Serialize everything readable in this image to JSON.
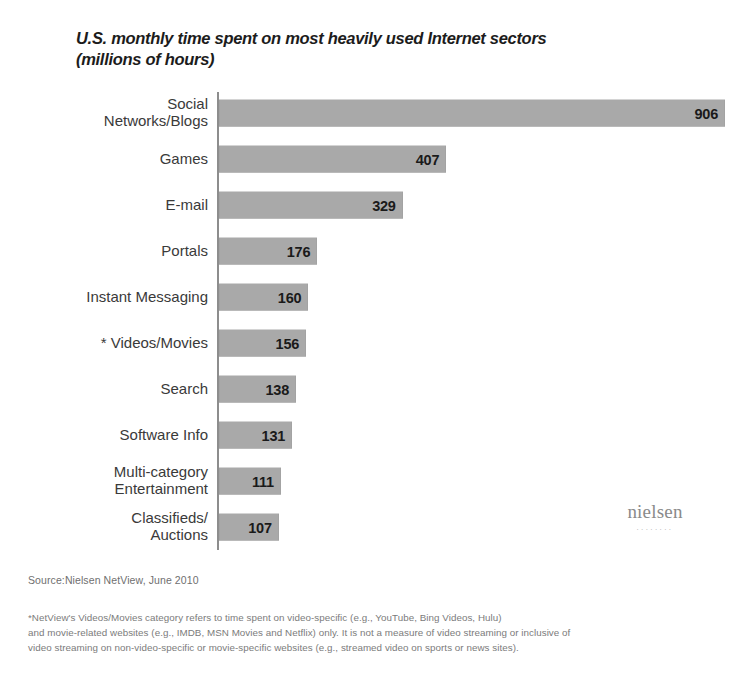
{
  "chart_data": {
    "type": "bar",
    "orientation": "horizontal",
    "title": "U.S. monthly time spent on most heavily used Internet sectors (millions of hours)",
    "title_lines": [
      "U.S. monthly time spent on most heavily used Internet sectors",
      "(millions of hours)"
    ],
    "xlabel": "",
    "ylabel": "",
    "xlim": [
      0,
      906
    ],
    "grid": false,
    "legend": null,
    "categories": [
      "Social\nNetworks/Blogs",
      "Games",
      "E-mail",
      "Portals",
      "Instant Messaging",
      "* Videos/Movies",
      "Search",
      "Software Info",
      "Multi-category\nEntertainment",
      "Classifieds/\nAuctions"
    ],
    "values": [
      906,
      407,
      329,
      176,
      160,
      156,
      138,
      131,
      111,
      107
    ],
    "value_labels": [
      "906",
      "407",
      "329",
      "176",
      "160",
      "156",
      "138",
      "131",
      "111",
      "107"
    ],
    "bar_color": "#a9a9a9",
    "axis_color": "#8d8d8d"
  },
  "logo": {
    "wordmark": "nielsen",
    "underdots": "........"
  },
  "source": {
    "text": "Source:Nielsen NetView, June 2010"
  },
  "footnote": {
    "lines": [
      "*NetView's Videos/Movies category refers to time spent on video-specific (e.g., YouTube, Bing Videos, Hulu)",
      "and movie-related websites (e.g., IMDB, MSN Movies and Netflix) only. It is not a measure of video streaming or inclusive of",
      "video streaming on non-video-specific or movie-specific websites (e.g., streamed video on sports or news sites)."
    ]
  }
}
